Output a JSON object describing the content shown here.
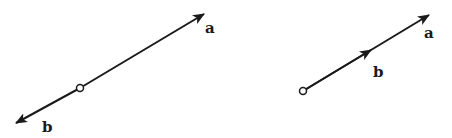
{
  "diagrams": [
    {
      "name": "opposite-vectors",
      "origin": {
        "x": 80,
        "y": 88
      },
      "vectors": [
        {
          "label": "a",
          "tip": {
            "x": 204,
            "y": 14
          },
          "label_pos": {
            "x": 205,
            "y": 33
          }
        },
        {
          "label": "b",
          "tip": {
            "x": 16,
            "y": 123
          },
          "label_pos": {
            "x": 42,
            "y": 132
          }
        }
      ]
    },
    {
      "name": "collinear-same-direction-vectors",
      "origin": {
        "x": 303,
        "y": 91
      },
      "vectors": [
        {
          "label": "a",
          "tip": {
            "x": 429,
            "y": 15
          },
          "label_pos": {
            "x": 424,
            "y": 38
          }
        },
        {
          "label": "b",
          "tip": {
            "x": 371,
            "y": 50
          },
          "label_pos": {
            "x": 373,
            "y": 77
          }
        }
      ]
    }
  ],
  "colors": {
    "stroke": "#1a1a1a",
    "background": "#ffffff"
  }
}
